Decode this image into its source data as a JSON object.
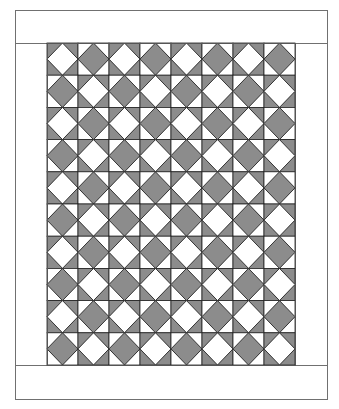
{
  "quilt": {
    "title": "Quilt layout diagram",
    "outer": {
      "x": 15,
      "y": 10,
      "width": 312,
      "height": 389
    },
    "top_border": {
      "height": 33
    },
    "bottom_border": {
      "height": 34
    },
    "center": {
      "x": 47,
      "y": 43,
      "width": 248,
      "height": 322
    },
    "grid": {
      "rows": 10,
      "cols": 8
    },
    "block_types": {
      "even": {
        "name": "white-diamond-gray-corners",
        "diamond": "#ffffff",
        "corners": "#8c8c8c"
      },
      "odd": {
        "name": "gray-diamond-white-corners",
        "diamond": "#8c8c8c",
        "corners": "#ffffff"
      }
    },
    "colors": {
      "line": "#222222",
      "border_line": "#707070",
      "background": "#ffffff",
      "gray": "#8c8c8c"
    }
  }
}
